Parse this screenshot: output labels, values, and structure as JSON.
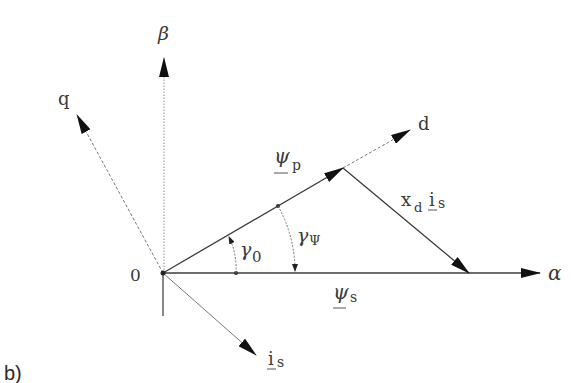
{
  "figure": {
    "panel_label": "b)",
    "origin_label": "0",
    "axes": {
      "alpha": "α",
      "beta": "β",
      "d": "d",
      "q": "q"
    },
    "vectors": {
      "psi_p": {
        "symbol": "ψ",
        "subscript": "p"
      },
      "psi_s": {
        "symbol": "ψ",
        "subscript": "s"
      },
      "xd_is": {
        "symbol": "x",
        "subscript": "d",
        "symbol2": "i",
        "subscript2": "s"
      },
      "i_s": {
        "symbol": "i",
        "subscript": "s"
      }
    },
    "angles": {
      "gamma_0": {
        "symbol": "γ",
        "subscript": "0"
      },
      "gamma_psi": {
        "symbol": "γ",
        "subscript": "Ψ"
      }
    },
    "colors": {
      "line": "#3c3c3c",
      "arrow": "#111111",
      "dotted": "#8a8a8a",
      "text": "#3a3a3a"
    }
  }
}
